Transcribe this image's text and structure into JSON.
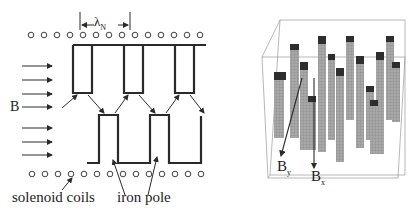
{
  "left_diagram": {
    "wavelength_label": "λ",
    "wavelength_subscript": "N",
    "field_label": "B",
    "coil_label": "solenoid coils",
    "pole_label": "iron pole"
  },
  "right_diagram": {
    "bx_label": "B",
    "bx_sub": "x",
    "by_label": "B",
    "by_sub": "y"
  },
  "colors": {
    "line": "#2a2a2a",
    "bar_face": "#9a9a9a",
    "bar_top": "#2e2e2e",
    "box": "#888888"
  }
}
